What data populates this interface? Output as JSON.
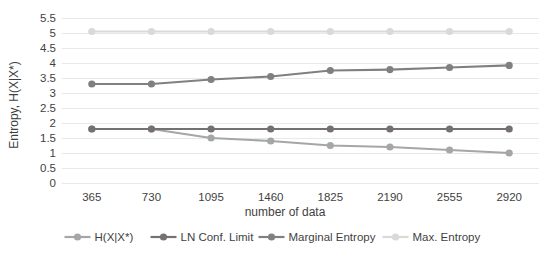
{
  "chart_data": {
    "type": "line",
    "title": "",
    "xlabel": "number of data",
    "ylabel": "Entropy, H(X|X*)",
    "categories": [
      "365",
      "730",
      "1095",
      "1460",
      "1825",
      "2190",
      "2555",
      "2920"
    ],
    "x": [
      365,
      730,
      1095,
      1460,
      1825,
      2190,
      2555,
      2920
    ],
    "ylim": [
      0,
      5.5
    ],
    "ytick_labels": [
      "5.5",
      "5",
      "4.5",
      "4",
      "3.5",
      "3",
      "2.5",
      "2",
      "1.5",
      "1",
      "0.5",
      "0"
    ],
    "ytick_values": [
      5.5,
      5,
      4.5,
      4,
      3.5,
      3,
      2.5,
      2,
      1.5,
      1,
      0.5,
      0
    ],
    "grid": true,
    "legend_position": "bottom",
    "series": [
      {
        "name": "H(X|X*)",
        "color": "#a6a6a6",
        "values": [
          1.8,
          1.8,
          1.5,
          1.4,
          1.25,
          1.2,
          1.1,
          1.0
        ]
      },
      {
        "name": "LN Conf. Limit",
        "color": "#767171",
        "values": [
          1.8,
          1.8,
          1.8,
          1.8,
          1.8,
          1.8,
          1.8,
          1.8
        ]
      },
      {
        "name": "Marginal Entropy",
        "color": "#808080",
        "values": [
          3.3,
          3.3,
          3.45,
          3.55,
          3.75,
          3.78,
          3.85,
          3.92
        ]
      },
      {
        "name": "Max. Entropy",
        "color": "#d9d9d9",
        "values": [
          5.05,
          5.05,
          5.05,
          5.05,
          5.05,
          5.05,
          5.05,
          5.05
        ]
      }
    ]
  },
  "axes": {
    "y_title": "Entropy, H(X|X*)",
    "x_title": "number of data",
    "y_ticks": [
      "5.5",
      "5",
      "4.5",
      "4",
      "3.5",
      "3",
      "2.5",
      "2",
      "1.5",
      "1",
      "0.5",
      "0"
    ],
    "x_ticks": [
      "365",
      "730",
      "1095",
      "1460",
      "1825",
      "2190",
      "2555",
      "2920"
    ]
  },
  "legend": {
    "items": [
      {
        "label": "H(X|X*)",
        "color": "#a6a6a6"
      },
      {
        "label": "LN Conf. Limit",
        "color": "#767171"
      },
      {
        "label": "Marginal Entropy",
        "color": "#808080"
      },
      {
        "label": "Max. Entropy",
        "color": "#d9d9d9"
      }
    ]
  },
  "style": {
    "grid_color": "#e8e8e8",
    "text_color": "#3f3f3f",
    "background": "#ffffff"
  }
}
